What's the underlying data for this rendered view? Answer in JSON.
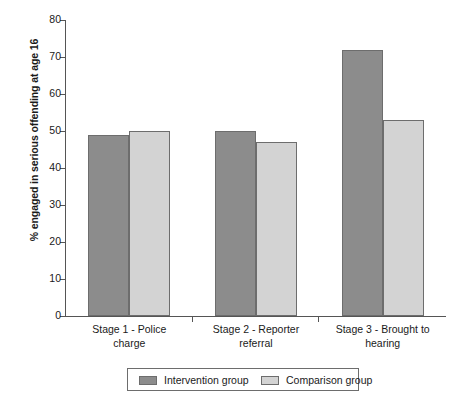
{
  "chart_data": {
    "type": "bar",
    "title": "",
    "xlabel": "",
    "ylabel": "% engaged in serious offending at age 16",
    "ylim": [
      0,
      80
    ],
    "yticks": [
      0,
      10,
      20,
      30,
      40,
      50,
      60,
      70,
      80
    ],
    "grid": false,
    "legend_position": "bottom",
    "categories": [
      "Stage 1 - Police charge",
      "Stage 2 - Reporter referral",
      "Stage 3 - Brought to hearing"
    ],
    "category_lines": [
      [
        "Stage 1 - Police",
        "charge"
      ],
      [
        "Stage 2 - Reporter",
        "referral"
      ],
      [
        "Stage 3 - Brought to",
        "hearing"
      ]
    ],
    "series": [
      {
        "name": "Intervention group",
        "color": "#8c8c8c",
        "values": [
          49,
          50,
          72
        ]
      },
      {
        "name": "Comparison group",
        "color": "#d3d3d3",
        "values": [
          50,
          47,
          53
        ]
      }
    ]
  }
}
